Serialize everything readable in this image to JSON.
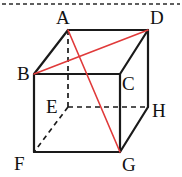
{
  "figure": {
    "shape_name": "cube",
    "stroke_color": "#1a1a1a",
    "diagonal_color": "#e03a3a",
    "hidden_edge_color": "#1a1a1a",
    "background_color": "#ffffff",
    "top_border": {
      "name": "top-dashed-border",
      "y": 4,
      "x1": 2,
      "x2": 180,
      "style": "dashed",
      "color": "#2a2a2a"
    },
    "vertices": [
      {
        "id": "A",
        "label": "A",
        "x": 68,
        "y": 30,
        "label_x": 56,
        "label_y": 24,
        "hidden": false
      },
      {
        "id": "B",
        "label": "B",
        "x": 34,
        "y": 74,
        "label_x": 17,
        "label_y": 80,
        "hidden": false
      },
      {
        "id": "C",
        "label": "C",
        "x": 120,
        "y": 74,
        "label_x": 122,
        "label_y": 90,
        "hidden": false
      },
      {
        "id": "D",
        "label": "D",
        "x": 148,
        "y": 30,
        "label_x": 150,
        "label_y": 24,
        "hidden": false
      },
      {
        "id": "E",
        "label": "E",
        "x": 68,
        "y": 107,
        "label_x": 46,
        "label_y": 113,
        "hidden": true
      },
      {
        "id": "F",
        "label": "F",
        "x": 34,
        "y": 152,
        "label_x": 14,
        "label_y": 170,
        "hidden": false
      },
      {
        "id": "G",
        "label": "G",
        "x": 120,
        "y": 152,
        "label_x": 122,
        "label_y": 171,
        "hidden": false
      },
      {
        "id": "H",
        "label": "H",
        "x": 148,
        "y": 107,
        "label_x": 152,
        "label_y": 117,
        "hidden": false
      }
    ],
    "solid_edges": [
      {
        "name": "edge-AD",
        "from": "A",
        "to": "D"
      },
      {
        "name": "edge-AB",
        "from": "A",
        "to": "B"
      },
      {
        "name": "edge-DC",
        "from": "D",
        "to": "C"
      },
      {
        "name": "edge-DH",
        "from": "D",
        "to": "H"
      },
      {
        "name": "edge-BC",
        "from": "B",
        "to": "C"
      },
      {
        "name": "edge-BF",
        "from": "B",
        "to": "F"
      },
      {
        "name": "edge-CG",
        "from": "C",
        "to": "G"
      },
      {
        "name": "edge-FG",
        "from": "F",
        "to": "G"
      },
      {
        "name": "edge-GH",
        "from": "G",
        "to": "H"
      }
    ],
    "dashed_edges": [
      {
        "name": "edge-AE",
        "from": "A",
        "to": "E"
      },
      {
        "name": "edge-EF",
        "from": "E",
        "to": "F"
      },
      {
        "name": "edge-EH",
        "from": "E",
        "to": "H"
      }
    ],
    "diagonals": [
      {
        "name": "diagonal-BD",
        "from": "B",
        "to": "D"
      },
      {
        "name": "diagonal-AG",
        "from": "A",
        "to": "G"
      }
    ]
  }
}
